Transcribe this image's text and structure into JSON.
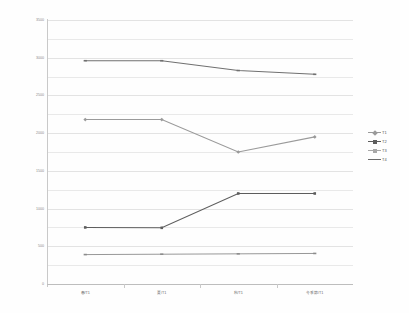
{
  "chart_data": {
    "type": "line",
    "title": "",
    "subtitle": "",
    "xlabel": "",
    "ylabel": "",
    "ylim": [
      0,
      3500
    ],
    "ytick_interval": 500,
    "gridline_interval": 250,
    "grid": true,
    "legend_position": "right",
    "categories": [
      "春/T1",
      "夏/T1",
      "秋/T1",
      "冬季節/T1"
    ],
    "ytick_labels": [
      "3500",
      "3000",
      "2500",
      "2000",
      "1500",
      "1000",
      "500",
      "0"
    ],
    "ytick_values": [
      3500,
      3000,
      2500,
      2000,
      1500,
      1000,
      500,
      0
    ],
    "series": [
      {
        "name": "T1",
        "color": "#9a9a9a",
        "marker": "diamond",
        "values": [
          2180,
          2180,
          1750,
          1950
        ]
      },
      {
        "name": "T2",
        "color": "#5d5d5d",
        "marker": "square",
        "values": [
          750,
          745,
          1200,
          1200
        ]
      },
      {
        "name": "T3",
        "color": "#707070",
        "marker": "dash",
        "values": [
          2960,
          2960,
          2830,
          2780
        ]
      },
      {
        "name": "T4",
        "color": "#8c8c8c",
        "marker": "line",
        "values": [
          390,
          395,
          400,
          405
        ]
      }
    ]
  },
  "legend": {
    "entries": [
      {
        "label": "T1",
        "color": "#9a9a9a"
      },
      {
        "label": "T2",
        "color": "#5d5d5d"
      },
      {
        "label": "T3",
        "color": "#a8a8a8"
      },
      {
        "label": "T4",
        "color": "#6b6b6b"
      }
    ]
  }
}
